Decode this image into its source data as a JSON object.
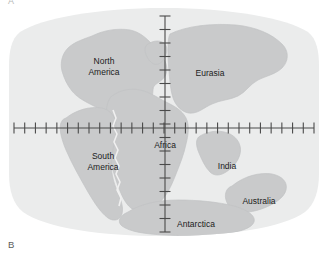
{
  "figure": {
    "panel_letters": [
      {
        "name": "panel-letter-a",
        "label": "A"
      },
      {
        "name": "panel-letter-b",
        "label": "B"
      }
    ],
    "colors": {
      "background": "#ffffff",
      "ocean": "#eceded",
      "land": "#c9cacb",
      "land_stroke": "#bdbebf",
      "axis": "#4a4a4a",
      "label_text": "#1b1b1b",
      "panel_letter": "#5b5b5b"
    }
  },
  "map": {
    "projection_note": "oval world projection",
    "axes": {
      "horizontal": {
        "name": "equator-axis",
        "y": 122,
        "x_start": 14,
        "x_end": 314,
        "tick_count": 29,
        "tick_spacing": 10.7,
        "tick_length": 11
      },
      "vertical": {
        "name": "prime-meridian-axis",
        "x": 165,
        "y_start": 10,
        "y_end": 226,
        "tick_count": 17,
        "tick_spacing": 13.0,
        "tick_length": 11
      }
    },
    "labels": [
      {
        "name": "label-north-america",
        "text": "North\nAmerica",
        "x": 78,
        "y": 50,
        "width": 52
      },
      {
        "name": "label-eurasia",
        "text": "Eurasia",
        "x": 186,
        "y": 62,
        "width": 48
      },
      {
        "name": "label-africa",
        "text": "Africa",
        "x": 142,
        "y": 134,
        "width": 46
      },
      {
        "name": "label-south-america",
        "text": "South\nAmerica",
        "x": 76,
        "y": 145,
        "width": 54
      },
      {
        "name": "label-india",
        "text": "India",
        "x": 210,
        "y": 155,
        "width": 34
      },
      {
        "name": "label-australia",
        "text": "Australia",
        "x": 236,
        "y": 190,
        "width": 46
      },
      {
        "name": "label-antarctica",
        "text": "Antarctica",
        "x": 170,
        "y": 213,
        "width": 52
      }
    ]
  }
}
